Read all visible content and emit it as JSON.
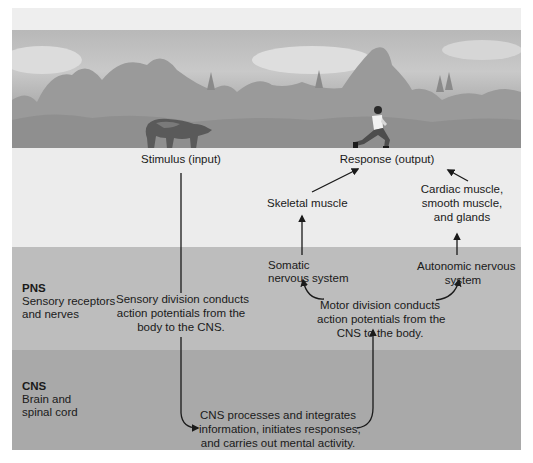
{
  "scene": {
    "stimulus_image": "bear-icon",
    "response_image": "running-person-icon"
  },
  "top_row": {
    "stimulus_label": "Stimulus (input)",
    "response_label": "Response (output)"
  },
  "effectors": {
    "skeletal_muscle": "Skeletal muscle",
    "cardiac_line1": "Cardiac muscle,",
    "cardiac_line2": "smooth muscle,",
    "cardiac_line3": "and glands"
  },
  "pns": {
    "title": "PNS",
    "subtitle_line1": "Sensory receptors",
    "subtitle_line2": "and nerves",
    "sensory_line1": "Sensory division conducts",
    "sensory_line2": "action potentials from the",
    "sensory_line3": "body to the CNS.",
    "somatic_line1": "Somatic",
    "somatic_line2": "nervous system",
    "autonomic_line1": "Autonomic nervous",
    "autonomic_line2": "system",
    "motor_line1": "Motor division conducts",
    "motor_line2": "action potentials from the",
    "motor_line3": "CNS to the body."
  },
  "cns": {
    "title": "CNS",
    "subtitle_line1": "Brain and",
    "subtitle_line2": "spinal cord",
    "process_line1": "CNS processes and integrates",
    "process_line2": "information, initiates responses,",
    "process_line3": "and carries out mental activity."
  },
  "colors": {
    "top_strip": "#eeeeee",
    "light_band": "#ececec",
    "pns_band": "#bdbdbd",
    "cns_band": "#a9a9a9",
    "arrow": "#1a1a1a"
  }
}
